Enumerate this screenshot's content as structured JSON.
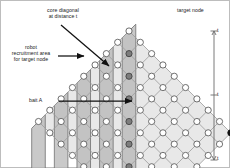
{
  "figure": {
    "type": "lattice-diagram",
    "title": "",
    "background": "#ffffff",
    "width": 230,
    "height": 168
  },
  "labels": {
    "core_diagonal": "core diagonal",
    "core_diagonal_2": "at distance t",
    "recruitment_1": "robot",
    "recruitment_2": "recruitment area",
    "recruitment_3": "for target node",
    "bait": "bait A",
    "target_node": "target node",
    "scale_tick_top": "t",
    "scale_tick_mid": "t",
    "scale_tick_bottom": "t"
  },
  "colors": {
    "node_stroke": "#555555",
    "node_fill": "#ffffff",
    "target_fill": "#111111",
    "bait_fill": "#7d7d7d",
    "bait_stroke": "#3d3d3d",
    "edge": "#9a9a9a",
    "band_fill": "#b4b4b4",
    "band_stroke": "#6e6e6e",
    "inner_fill": "#e8e8e8",
    "arrow": "#111111",
    "text": "#1a1a1a",
    "scale_line": "#6b6b6b",
    "border": "#bdbdbd"
  },
  "lattice": {
    "rotation_deg": 45,
    "rows": 9,
    "cols": 10,
    "spacing_px": 16,
    "origin": {
      "x": 128,
      "y": 30
    },
    "target_node": {
      "row": 0,
      "col": 9
    },
    "bait_nodes": [
      {
        "row": 1,
        "col": 1
      },
      {
        "row": 2,
        "col": 2
      },
      {
        "row": 3,
        "col": 3
      },
      {
        "row": 4,
        "col": 4
      },
      {
        "row": 5,
        "col": 5
      },
      {
        "row": 6,
        "col": 6
      },
      {
        "row": 7,
        "col": 7
      }
    ]
  },
  "scale_bar": {
    "label": "t",
    "segments": 3,
    "x": 213,
    "y_top": 29,
    "y_bottom": 160
  }
}
